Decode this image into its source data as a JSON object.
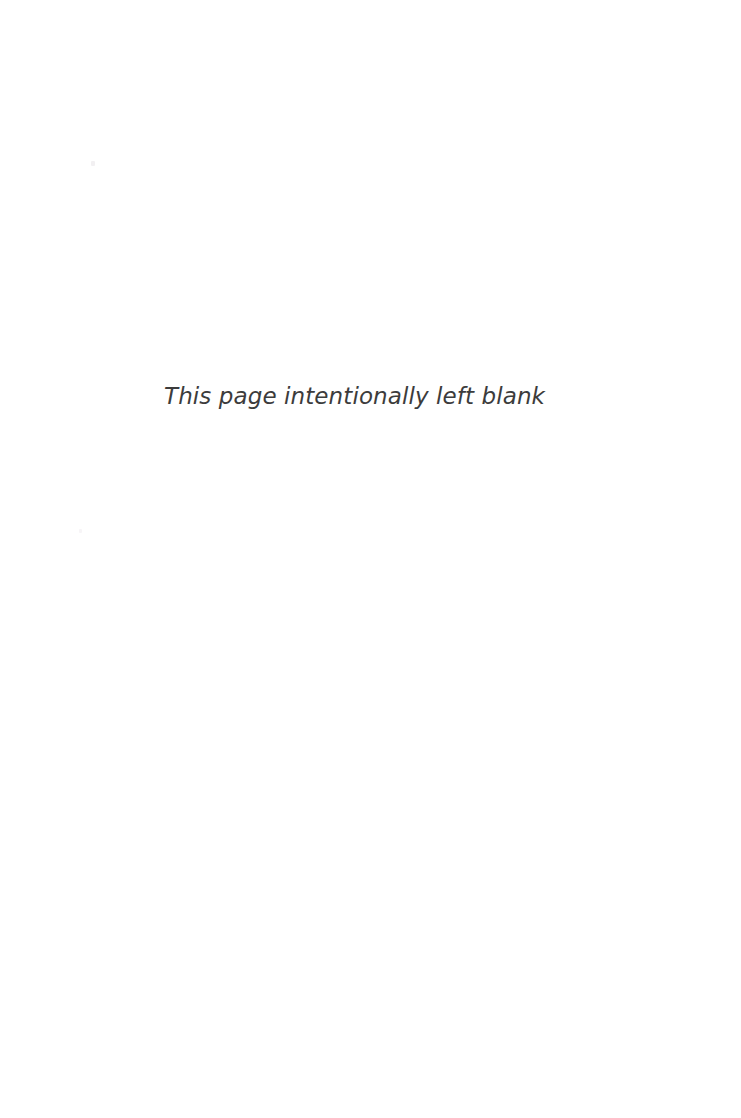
{
  "page": {
    "name": "intentionally-blank-page",
    "width": 741,
    "height": 1118,
    "background_color": "#ffffff"
  },
  "notice": {
    "text": "This page intentionally left blank",
    "color": "#3c3c3c",
    "font_size_px": 23,
    "font_style": "italic",
    "align": "center",
    "baseline_y": 404
  },
  "artifacts": {
    "speck_color_upper": "#f2f0f2",
    "speck_color_mid": "#f7f5f7"
  }
}
